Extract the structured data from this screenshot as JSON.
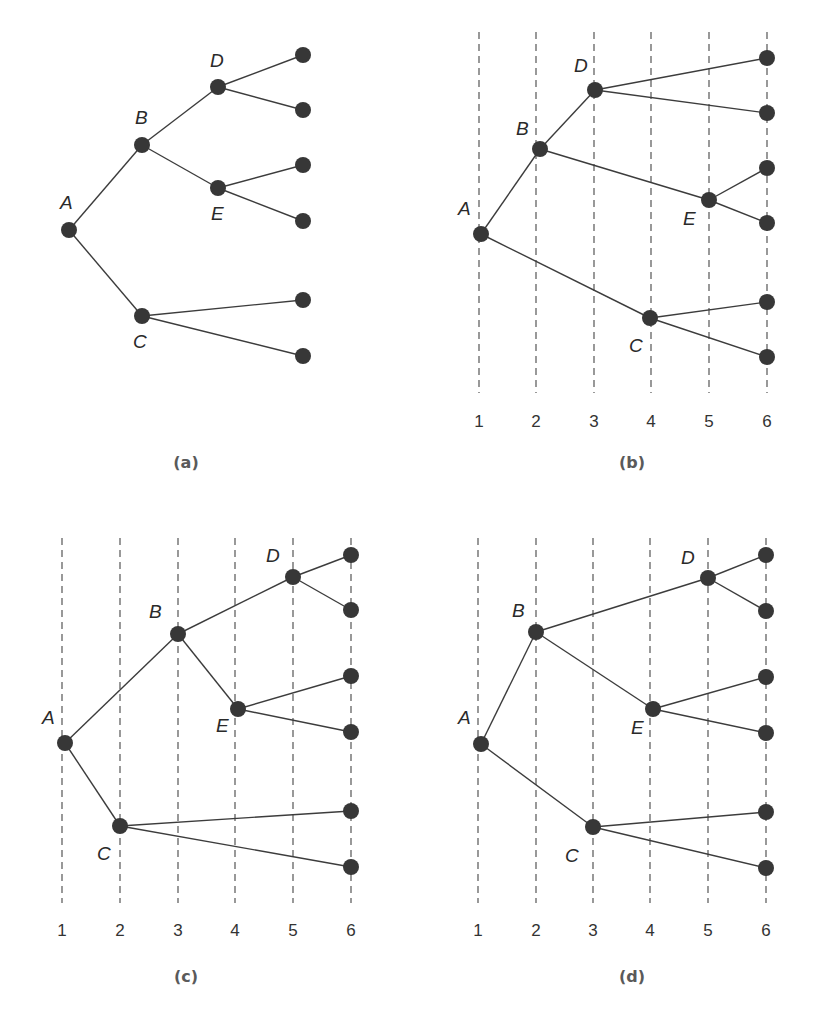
{
  "figure": {
    "node_color": "#373737",
    "edge_color": "#3c3c3c",
    "guide_color": "#555555"
  },
  "panels": [
    {
      "id": "a",
      "caption": "(a)",
      "caption_pos": [
        186,
        468
      ],
      "has_guides": false,
      "guides": [],
      "guide_y": [
        32,
        393
      ],
      "tick_labels": [],
      "tick_y": 428,
      "nodes": [
        {
          "id": "A",
          "label": "A",
          "x": 69,
          "y": 230,
          "lx": 60,
          "ly": 209
        },
        {
          "id": "B",
          "label": "B",
          "x": 142,
          "y": 145,
          "lx": 135,
          "ly": 124
        },
        {
          "id": "C",
          "label": "C",
          "x": 142,
          "y": 316,
          "lx": 133,
          "ly": 348
        },
        {
          "id": "D",
          "label": "D",
          "x": 218,
          "y": 87,
          "lx": 210,
          "ly": 67
        },
        {
          "id": "E",
          "label": "E",
          "x": 218,
          "y": 188,
          "lx": 211,
          "ly": 220
        },
        {
          "id": "L1",
          "label": "",
          "x": 303,
          "y": 55
        },
        {
          "id": "L2",
          "label": "",
          "x": 303,
          "y": 110
        },
        {
          "id": "L3",
          "label": "",
          "x": 303,
          "y": 165
        },
        {
          "id": "L4",
          "label": "",
          "x": 303,
          "y": 221
        },
        {
          "id": "L5",
          "label": "",
          "x": 303,
          "y": 300
        },
        {
          "id": "L6",
          "label": "",
          "x": 303,
          "y": 356
        }
      ]
    },
    {
      "id": "b",
      "caption": "(b)",
      "caption_pos": [
        632,
        468
      ],
      "has_guides": true,
      "guides": [
        479,
        536,
        594,
        651,
        709,
        767
      ],
      "guide_y": [
        32,
        393
      ],
      "tick_labels": [
        "1",
        "2",
        "3",
        "4",
        "5",
        "6"
      ],
      "tick_y": 427,
      "nodes": [
        {
          "id": "A",
          "label": "A",
          "x": 481,
          "y": 234,
          "lx": 458,
          "ly": 215
        },
        {
          "id": "B",
          "label": "B",
          "x": 540,
          "y": 149,
          "lx": 516,
          "ly": 135
        },
        {
          "id": "C",
          "label": "C",
          "x": 650,
          "y": 318,
          "lx": 629,
          "ly": 352
        },
        {
          "id": "D",
          "label": "D",
          "x": 595,
          "y": 90,
          "lx": 574,
          "ly": 72
        },
        {
          "id": "E",
          "label": "E",
          "x": 709,
          "y": 200,
          "lx": 683,
          "ly": 225
        },
        {
          "id": "L1",
          "label": "",
          "x": 767,
          "y": 58
        },
        {
          "id": "L2",
          "label": "",
          "x": 767,
          "y": 113
        },
        {
          "id": "L3",
          "label": "",
          "x": 767,
          "y": 168
        },
        {
          "id": "L4",
          "label": "",
          "x": 767,
          "y": 223
        },
        {
          "id": "L5",
          "label": "",
          "x": 767,
          "y": 302
        },
        {
          "id": "L6",
          "label": "",
          "x": 767,
          "y": 357
        }
      ]
    },
    {
      "id": "c",
      "caption": "(c)",
      "caption_pos": [
        186,
        982
      ],
      "has_guides": true,
      "guides": [
        62,
        120,
        178,
        235,
        293,
        351
      ],
      "guide_y": [
        538,
        903
      ],
      "tick_labels": [
        "1",
        "2",
        "3",
        "4",
        "5",
        "6"
      ],
      "tick_y": 936,
      "nodes": [
        {
          "id": "A",
          "label": "A",
          "x": 65,
          "y": 743,
          "lx": 42,
          "ly": 724
        },
        {
          "id": "B",
          "label": "B",
          "x": 178,
          "y": 634,
          "lx": 149,
          "ly": 618
        },
        {
          "id": "C",
          "label": "C",
          "x": 120,
          "y": 826,
          "lx": 97,
          "ly": 860
        },
        {
          "id": "D",
          "label": "D",
          "x": 293,
          "y": 577,
          "lx": 266,
          "ly": 562
        },
        {
          "id": "E",
          "label": "E",
          "x": 238,
          "y": 709,
          "lx": 216,
          "ly": 732
        },
        {
          "id": "L1",
          "label": "",
          "x": 351,
          "y": 555
        },
        {
          "id": "L2",
          "label": "",
          "x": 351,
          "y": 610
        },
        {
          "id": "L3",
          "label": "",
          "x": 351,
          "y": 676
        },
        {
          "id": "L4",
          "label": "",
          "x": 351,
          "y": 732
        },
        {
          "id": "L5",
          "label": "",
          "x": 351,
          "y": 811
        },
        {
          "id": "L6",
          "label": "",
          "x": 351,
          "y": 867
        }
      ]
    },
    {
      "id": "d",
      "caption": "(d)",
      "caption_pos": [
        632,
        982
      ],
      "has_guides": true,
      "guides": [
        478,
        536,
        593,
        650,
        708,
        766
      ],
      "guide_y": [
        538,
        903
      ],
      "tick_labels": [
        "1",
        "2",
        "3",
        "4",
        "5",
        "6"
      ],
      "tick_y": 936,
      "nodes": [
        {
          "id": "A",
          "label": "A",
          "x": 481,
          "y": 744,
          "lx": 458,
          "ly": 724
        },
        {
          "id": "B",
          "label": "B",
          "x": 536,
          "y": 632,
          "lx": 512,
          "ly": 617
        },
        {
          "id": "C",
          "label": "C",
          "x": 593,
          "y": 827,
          "lx": 565,
          "ly": 862
        },
        {
          "id": "D",
          "label": "D",
          "x": 708,
          "y": 578,
          "lx": 681,
          "ly": 564
        },
        {
          "id": "E",
          "label": "E",
          "x": 653,
          "y": 709,
          "lx": 631,
          "ly": 734
        },
        {
          "id": "L1",
          "label": "",
          "x": 766,
          "y": 555
        },
        {
          "id": "L2",
          "label": "",
          "x": 766,
          "y": 611
        },
        {
          "id": "L3",
          "label": "",
          "x": 766,
          "y": 677
        },
        {
          "id": "L4",
          "label": "",
          "x": 766,
          "y": 733
        },
        {
          "id": "L5",
          "label": "",
          "x": 766,
          "y": 812
        },
        {
          "id": "L6",
          "label": "",
          "x": 766,
          "y": 868
        }
      ]
    }
  ],
  "edges": [
    [
      "A",
      "B"
    ],
    [
      "A",
      "C"
    ],
    [
      "B",
      "D"
    ],
    [
      "B",
      "E"
    ],
    [
      "D",
      "L1"
    ],
    [
      "D",
      "L2"
    ],
    [
      "E",
      "L3"
    ],
    [
      "E",
      "L4"
    ],
    [
      "C",
      "L5"
    ],
    [
      "C",
      "L6"
    ]
  ]
}
